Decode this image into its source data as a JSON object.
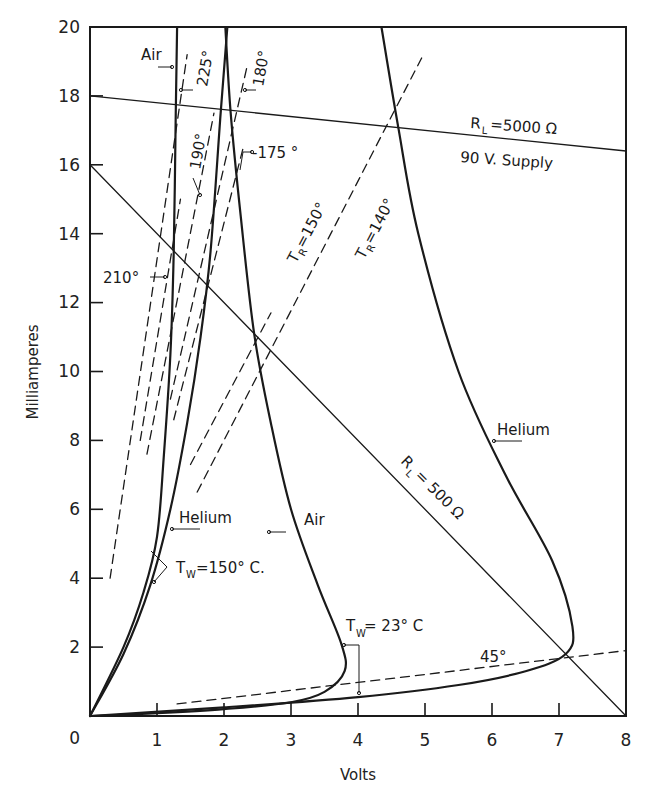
{
  "chart_data": {
    "type": "line",
    "title": "",
    "xlabel": "Volts",
    "ylabel": "Milliamperes",
    "xlim": [
      0,
      8
    ],
    "ylim": [
      0,
      20
    ],
    "grid": false,
    "xticks": [
      "0",
      "1",
      "2",
      "3",
      "4",
      "5",
      "6",
      "7",
      "8"
    ],
    "yticks": [
      "0",
      "2",
      "4",
      "6",
      "8",
      "10",
      "12",
      "14",
      "16",
      "18",
      "20"
    ],
    "series": [
      {
        "name": "Air, Tw=23° C",
        "style": "solid-thick",
        "points": [
          [
            0,
            0
          ],
          [
            1,
            0.08
          ],
          [
            2,
            0.2
          ],
          [
            3,
            0.4
          ],
          [
            3.5,
            0.7
          ],
          [
            3.8,
            1.3
          ],
          [
            3.75,
            2.1
          ],
          [
            3.4,
            3.8
          ],
          [
            3.0,
            6.0
          ],
          [
            2.7,
            8.5
          ],
          [
            2.45,
            11.1
          ],
          [
            2.25,
            14.5
          ],
          [
            2.1,
            17.5
          ],
          [
            2.02,
            20
          ]
        ]
      },
      {
        "name": "Helium, Tw=23° C",
        "style": "solid-thick",
        "points": [
          [
            0,
            0
          ],
          [
            2,
            0.25
          ],
          [
            4,
            0.55
          ],
          [
            5.5,
            0.9
          ],
          [
            6.5,
            1.3
          ],
          [
            7.1,
            1.8
          ],
          [
            7.2,
            2.6
          ],
          [
            6.9,
            4.5
          ],
          [
            6.2,
            7.0
          ],
          [
            5.5,
            10
          ],
          [
            4.9,
            14
          ],
          [
            4.6,
            17.1
          ],
          [
            4.35,
            20
          ]
        ]
      },
      {
        "name": "Air, Tw=150° C",
        "style": "solid-thick",
        "points": [
          [
            0,
            0
          ],
          [
            0.5,
            2.0
          ],
          [
            0.8,
            3.6
          ],
          [
            1.0,
            5.2
          ],
          [
            1.1,
            7.5
          ],
          [
            1.2,
            10.5
          ],
          [
            1.25,
            13.5
          ],
          [
            1.28,
            17.5
          ],
          [
            1.3,
            20
          ]
        ]
      },
      {
        "name": "Helium, Tw=150° C",
        "style": "solid-thick",
        "points": [
          [
            0,
            0
          ],
          [
            0.5,
            1.8
          ],
          [
            0.9,
            3.8
          ],
          [
            1.2,
            6.0
          ],
          [
            1.45,
            8.5
          ],
          [
            1.65,
            11.0
          ],
          [
            1.8,
            13.5
          ],
          [
            1.95,
            17.5
          ],
          [
            2.05,
            20
          ]
        ]
      },
      {
        "name": "RL = 5000 Ω (90 V. Supply)",
        "style": "solid-thin",
        "points": [
          [
            0,
            18
          ],
          [
            8,
            16.4
          ]
        ]
      },
      {
        "name": "RL = 500 Ω",
        "style": "solid-thin",
        "points": [
          [
            0,
            16
          ],
          [
            8,
            0
          ]
        ]
      },
      {
        "name": "TR = 140°",
        "style": "dashed",
        "points": [
          [
            1.6,
            6.5
          ],
          [
            4.95,
            19.1
          ]
        ]
      },
      {
        "name": "TR = 150°",
        "style": "dashed",
        "points": [
          [
            1.5,
            7.3
          ],
          [
            2.7,
            11.7
          ]
        ]
      },
      {
        "name": "175°",
        "style": "dashed",
        "points": [
          [
            1.25,
            8.6
          ],
          [
            2.3,
            16.6
          ]
        ]
      },
      {
        "name": "180°",
        "style": "dashed",
        "points": [
          [
            1.2,
            9.2
          ],
          [
            2.35,
            18.9
          ]
        ]
      },
      {
        "name": "190°",
        "style": "dashed",
        "points": [
          [
            0.85,
            7.6
          ],
          [
            1.85,
            17.5
          ]
        ]
      },
      {
        "name": "210°",
        "style": "dashed",
        "points": [
          [
            0.75,
            8.0
          ],
          [
            1.35,
            15.0
          ]
        ]
      },
      {
        "name": "225°",
        "style": "dashed",
        "points": [
          [
            0.3,
            4.0
          ],
          [
            1.45,
            19.2
          ]
        ]
      },
      {
        "name": "45°",
        "style": "dashed",
        "points": [
          [
            1.3,
            0.35
          ],
          [
            8,
            1.9
          ]
        ]
      }
    ],
    "annotations": [
      {
        "text": "Air",
        "x": 0.95,
        "y": 19.0
      },
      {
        "text": "225°",
        "x": 1.5,
        "y": 19.0,
        "rotation": -80
      },
      {
        "text": "180°",
        "x": 2.4,
        "y": 19.0,
        "rotation": -80
      },
      {
        "text": "190°",
        "x": 1.6,
        "y": 16.0,
        "rotation": -80
      },
      {
        "text": "175°",
        "x": 2.5,
        "y": 16.4
      },
      {
        "text": "210°",
        "x": 0.4,
        "y": 12.8
      },
      {
        "text": "TR = 150°",
        "x": 2.9,
        "y": 13.0,
        "rotation": -62
      },
      {
        "text": "TR = 140°",
        "x": 3.6,
        "y": 14.0,
        "rotation": -62
      },
      {
        "text": "RL = 5000 Ω",
        "x": 5.5,
        "y": 17.0
      },
      {
        "text": "90 V. Supply",
        "x": 5.0,
        "y": 15.9
      },
      {
        "text": "RL = 500 Ω",
        "x": 5.6,
        "y": 7.0,
        "rotation": 45
      },
      {
        "text": "Helium",
        "x": 6.0,
        "y": 8.2
      },
      {
        "text": "Helium",
        "x": 1.3,
        "y": 5.6
      },
      {
        "text": "Tw = 150° C.",
        "x": 1.3,
        "y": 4.3
      },
      {
        "text": "Air",
        "x": 3.1,
        "y": 5.5
      },
      {
        "text": "Tw = 23° C",
        "x": 3.5,
        "y": 2.3
      },
      {
        "text": "45°",
        "x": 5.4,
        "y": 1.8
      }
    ]
  },
  "labels": {
    "xlabel": "Volts",
    "ylabel": "Milliamperes",
    "x0": "0",
    "x1": "1",
    "x2": "2",
    "x3": "3",
    "x4": "4",
    "x5": "5",
    "x6": "6",
    "x7": "7",
    "x8": "8",
    "y2": "2",
    "y4": "4",
    "y6": "6",
    "y8": "8",
    "y10": "10",
    "y12": "12",
    "y14": "14",
    "y16": "16",
    "y18": "18",
    "y20": "20",
    "air_top": "Air",
    "deg225": "225°",
    "deg180": "180°",
    "deg190": "190°",
    "deg175": "-175 °",
    "deg210": "210°",
    "tr150_T": "T",
    "tr150_R": "R",
    "tr150_val": " =150°",
    "tr140_T": "T",
    "tr140_R": "R",
    "tr140_val": " =140°",
    "rl5000_R": "R",
    "rl5000_L": "L",
    "rl5000_val": " =5000 Ω",
    "supply": "90  V.  Supply",
    "rl500_R": "R",
    "rl500_L": "L",
    "rl500_val": " = 500 Ω",
    "helium_right": "Helium",
    "helium_left": "Helium",
    "tw150_T": "T",
    "tw150_W": "W",
    "tw150_val": "=150° C.",
    "air_mid": "Air",
    "tw23_T": "T",
    "tw23_W": "W",
    "tw23_val": " = 23° C",
    "deg45": "45°"
  }
}
